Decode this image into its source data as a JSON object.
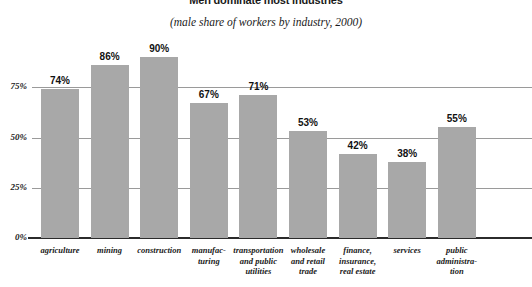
{
  "chart_data": {
    "type": "bar",
    "title": "Men dominate most industries",
    "subtitle": "(male share of workers by industry, 2000)",
    "xlabel": "",
    "ylabel": "",
    "ylim": [
      0,
      100
    ],
    "yticks": [
      0,
      25,
      50,
      75
    ],
    "ytick_labels": [
      "0%",
      "25%",
      "50%",
      "75%"
    ],
    "grid": true,
    "legend": "none",
    "bar_color": "#a8a8a8",
    "categories": [
      "agriculture",
      "mining",
      "construction",
      "manufac-\nturing",
      "transportation\nand public\nutilities",
      "wholesale\nand retail\ntrade",
      "finance,\ninsurance,\nreal estate",
      "services",
      "public\nadministra-\ntion"
    ],
    "values": [
      74,
      86,
      90,
      67,
      71,
      53,
      42,
      38,
      55
    ],
    "value_labels": [
      "74%",
      "86%",
      "90%",
      "67%",
      "71%",
      "53%",
      "42%",
      "38%",
      "55%"
    ]
  },
  "axis": {
    "tick0": "0%",
    "tick1": "25%",
    "tick2": "50%",
    "tick3": "75%"
  },
  "bars": [
    {
      "label": "agriculture",
      "value_label": "74%",
      "line1": "agriculture",
      "line2": "",
      "line3": ""
    },
    {
      "label": "mining",
      "value_label": "86%",
      "line1": "mining",
      "line2": "",
      "line3": ""
    },
    {
      "label": "construction",
      "value_label": "90%",
      "line1": "construction",
      "line2": "",
      "line3": ""
    },
    {
      "label": "manufacturing",
      "value_label": "67%",
      "line1": "manufac-",
      "line2": "turing",
      "line3": ""
    },
    {
      "label": "transportation",
      "value_label": "71%",
      "line1": "transportation",
      "line2": "and public",
      "line3": "utilities"
    },
    {
      "label": "wholesale-retail",
      "value_label": "53%",
      "line1": "wholesale",
      "line2": "and retail",
      "line3": "trade"
    },
    {
      "label": "finance",
      "value_label": "42%",
      "line1": "finance,",
      "line2": "insurance,",
      "line3": "real estate"
    },
    {
      "label": "services",
      "value_label": "38%",
      "line1": "services",
      "line2": "",
      "line3": ""
    },
    {
      "label": "public-admin",
      "value_label": "55%",
      "line1": "public",
      "line2": "administra-",
      "line3": "tion"
    }
  ]
}
